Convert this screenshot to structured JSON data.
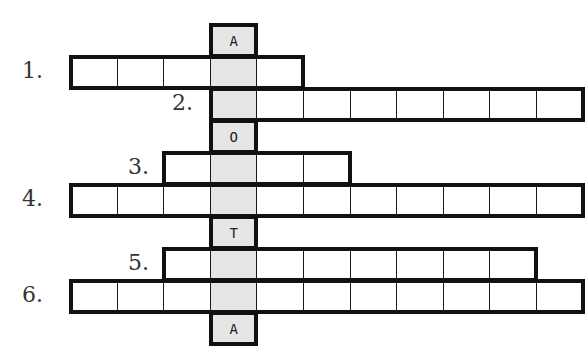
{
  "puzzle": {
    "type": "crossword",
    "key_column": 3,
    "key_color": "#e6e6e6",
    "grid_origin": {
      "x": 70,
      "y": 24
    },
    "cell_size": {
      "w": 46.6,
      "h": 32
    },
    "rows": [
      {
        "id": "top",
        "label": "",
        "start": 3,
        "end": 3,
        "letters": {
          "3": "A"
        }
      },
      {
        "id": "1",
        "label": "1.",
        "start": 0,
        "end": 4,
        "letters": {}
      },
      {
        "id": "2",
        "label": "2.",
        "start": 3,
        "end": 10,
        "letters": {}
      },
      {
        "id": "o",
        "label": "",
        "start": 3,
        "end": 3,
        "letters": {
          "3": "O"
        }
      },
      {
        "id": "3",
        "label": "3.",
        "start": 2,
        "end": 5,
        "letters": {}
      },
      {
        "id": "4",
        "label": "4.",
        "start": 0,
        "end": 10,
        "letters": {}
      },
      {
        "id": "t",
        "label": "",
        "start": 3,
        "end": 3,
        "letters": {
          "3": "T"
        }
      },
      {
        "id": "5",
        "label": "5.",
        "start": 2,
        "end": 9,
        "letters": {}
      },
      {
        "id": "6",
        "label": "6.",
        "start": 0,
        "end": 10,
        "letters": {}
      },
      {
        "id": "bottom",
        "label": "",
        "start": 3,
        "end": 3,
        "letters": {
          "3": "A"
        }
      }
    ],
    "labels": {
      "l1": "1.",
      "l2": "2.",
      "l3": "3.",
      "l4": "4.",
      "l5": "5.",
      "l6": "6."
    },
    "given_letters": {
      "top": "A",
      "o": "O",
      "t": "T",
      "bottom": "A"
    }
  }
}
